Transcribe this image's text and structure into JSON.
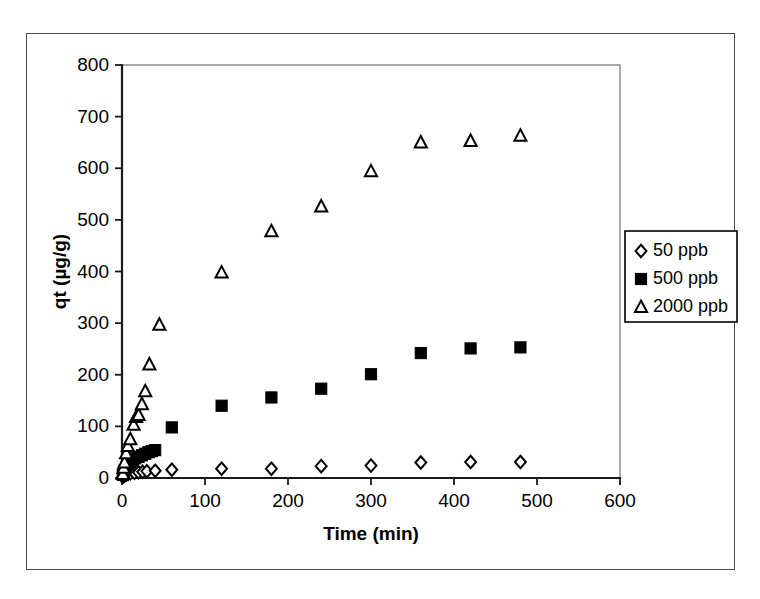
{
  "figure": {
    "background_color": "#ffffff",
    "frame_color": "#4a4a4a",
    "marker_color": "#000000"
  },
  "chart_data": {
    "type": "scatter",
    "title": "",
    "xlabel": "Time (min)",
    "ylabel": "qt (µg/g)",
    "xlim": [
      0,
      600
    ],
    "ylim": [
      0,
      800
    ],
    "xticks": [
      0,
      100,
      200,
      300,
      400,
      500,
      600
    ],
    "yticks": [
      0,
      100,
      200,
      300,
      400,
      500,
      600,
      700,
      800
    ],
    "grid": false,
    "legend_position": "right-outside",
    "series": [
      {
        "name": "50 ppb",
        "marker": "open-diamond",
        "color": "#000000",
        "points": [
          [
            1,
            2
          ],
          [
            2,
            4
          ],
          [
            3,
            5
          ],
          [
            5,
            7
          ],
          [
            7,
            8
          ],
          [
            10,
            9
          ],
          [
            15,
            10
          ],
          [
            20,
            11
          ],
          [
            25,
            12
          ],
          [
            30,
            13
          ],
          [
            40,
            14
          ],
          [
            60,
            16
          ],
          [
            120,
            18
          ],
          [
            180,
            18
          ],
          [
            240,
            23
          ],
          [
            300,
            24
          ],
          [
            360,
            30
          ],
          [
            420,
            31
          ],
          [
            480,
            31
          ]
        ]
      },
      {
        "name": "500 ppb",
        "marker": "filled-square",
        "color": "#000000",
        "points": [
          [
            1,
            6
          ],
          [
            2,
            10
          ],
          [
            3,
            14
          ],
          [
            5,
            20
          ],
          [
            7,
            25
          ],
          [
            10,
            30
          ],
          [
            13,
            34
          ],
          [
            16,
            38
          ],
          [
            20,
            41
          ],
          [
            24,
            44
          ],
          [
            28,
            47
          ],
          [
            32,
            50
          ],
          [
            36,
            52
          ],
          [
            40,
            54
          ],
          [
            60,
            98
          ],
          [
            120,
            140
          ],
          [
            180,
            156
          ],
          [
            240,
            173
          ],
          [
            300,
            201
          ],
          [
            360,
            242
          ],
          [
            420,
            251
          ],
          [
            480,
            253
          ]
        ]
      },
      {
        "name": "2000 ppb",
        "marker": "open-triangle",
        "color": "#000000",
        "points": [
          [
            1,
            8
          ],
          [
            2,
            20
          ],
          [
            3,
            30
          ],
          [
            5,
            48
          ],
          [
            7,
            62
          ],
          [
            10,
            75
          ],
          [
            14,
            103
          ],
          [
            17,
            118
          ],
          [
            20,
            122
          ],
          [
            24,
            143
          ],
          [
            28,
            168
          ],
          [
            33,
            220
          ],
          [
            45,
            297
          ],
          [
            120,
            398
          ],
          [
            180,
            478
          ],
          [
            240,
            526
          ],
          [
            300,
            594
          ],
          [
            360,
            650
          ],
          [
            420,
            653
          ],
          [
            480,
            663
          ]
        ]
      }
    ]
  },
  "legend": {
    "entries": [
      {
        "label": "50 ppb",
        "marker": "open-diamond"
      },
      {
        "label": "500 ppb",
        "marker": "filled-square"
      },
      {
        "label": "2000 ppb",
        "marker": "open-triangle"
      }
    ]
  }
}
